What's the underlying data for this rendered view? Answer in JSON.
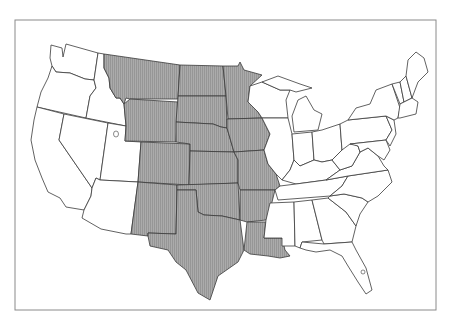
{
  "map": {
    "subject": "Contiguous United States",
    "colors": {
      "shaded_fill": "#a8a8a8",
      "hatch_line": "#8c8c8c",
      "unshaded_fill": "#ffffff",
      "border": "#3a3a3a",
      "frame": "#8a8a8a"
    },
    "shaded_states": [
      "Montana",
      "Wyoming",
      "Colorado",
      "New Mexico",
      "North Dakota",
      "South Dakota",
      "Nebraska",
      "Kansas",
      "Oklahoma",
      "Texas",
      "Minnesota",
      "Iowa",
      "Missouri",
      "Arkansas",
      "Louisiana"
    ],
    "unshaded_states": [
      "Washington",
      "Oregon",
      "California",
      "Idaho",
      "Nevada",
      "Utah",
      "Arizona",
      "Wisconsin",
      "Illinois",
      "Michigan",
      "Indiana",
      "Ohio",
      "Kentucky",
      "Tennessee",
      "Mississippi",
      "Alabama",
      "Georgia",
      "Florida",
      "South Carolina",
      "North Carolina",
      "Virginia",
      "West Virginia",
      "Maryland",
      "Delaware",
      "New Jersey",
      "Pennsylvania",
      "New York",
      "Connecticut",
      "Rhode Island",
      "Massachusetts",
      "Vermont",
      "New Hampshire",
      "Maine"
    ]
  }
}
